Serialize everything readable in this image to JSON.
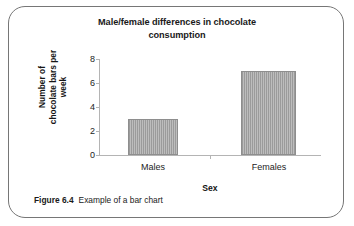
{
  "figure": {
    "caption_number": "Figure 6.4",
    "caption_text": "Example of a bar chart",
    "border_color": "#767676"
  },
  "chart_data": {
    "type": "bar",
    "title": "Male/female differences in chocolate consumption",
    "title_line1": "Male/female differences in chocolate",
    "title_line2": "consumption",
    "categories": [
      "Males",
      "Females"
    ],
    "values": [
      3,
      7
    ],
    "xlabel": "Sex",
    "ylabel": "Number of chocolate bars per week",
    "ylabel_line1": "Number of",
    "ylabel_line2": "chocolate bars per week",
    "ylim": [
      0,
      8
    ],
    "ytick_values": [
      8,
      6,
      4,
      2,
      0
    ],
    "ytick_labels": [
      "8",
      "6",
      "4",
      "2",
      "0"
    ],
    "grid": false,
    "legend": false,
    "bar_fill_color": "#a8a8a8",
    "bar_edge_color": "#8e8e8e",
    "axis_color": "#b4b4b4"
  }
}
